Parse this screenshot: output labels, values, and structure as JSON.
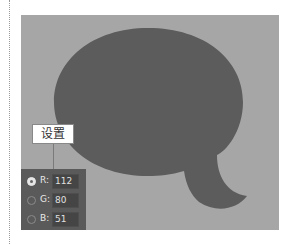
{
  "canvas": {
    "background": "#a6a6a6",
    "shape": {
      "type": "speech-bubble",
      "fill": "#5c5c5c"
    }
  },
  "callout": {
    "label": "设置"
  },
  "color_panel": {
    "channels": [
      {
        "label": "R:",
        "value": "112",
        "selected": true
      },
      {
        "label": "G:",
        "value": "80",
        "selected": false
      },
      {
        "label": "B:",
        "value": "51",
        "selected": false
      }
    ]
  }
}
